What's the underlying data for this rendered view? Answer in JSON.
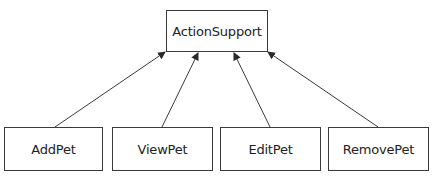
{
  "diagram": {
    "type": "class-hierarchy",
    "parent": {
      "id": "action-support",
      "label": "ActionSupport"
    },
    "children": [
      {
        "id": "add-pet",
        "label": "AddPet"
      },
      {
        "id": "view-pet",
        "label": "ViewPet"
      },
      {
        "id": "edit-pet",
        "label": "EditPet"
      },
      {
        "id": "remove-pet",
        "label": "RemovePet"
      }
    ],
    "edges": [
      {
        "from": "add-pet",
        "to": "action-support",
        "style": "arrow"
      },
      {
        "from": "view-pet",
        "to": "action-support",
        "style": "arrow"
      },
      {
        "from": "edit-pet",
        "to": "action-support",
        "style": "arrow"
      },
      {
        "from": "remove-pet",
        "to": "action-support",
        "style": "arrow"
      }
    ],
    "colors": {
      "stroke": "#3a3a3a",
      "text": "#222222",
      "background": "#ffffff"
    }
  }
}
